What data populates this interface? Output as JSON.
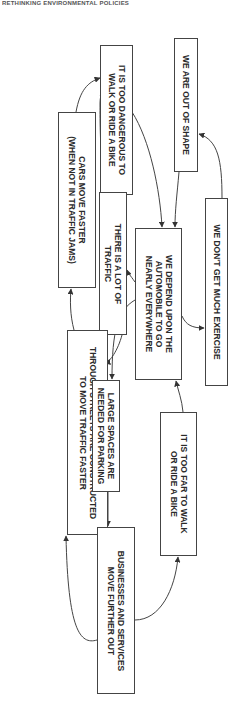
{
  "header": {
    "text": "RETHINKING ENVIRONMENTAL POLICIES"
  },
  "diagram": {
    "nodes": [
      {
        "id": "out_of_shape",
        "lines": [
          "WE ARE OUT OF SHAPE"
        ]
      },
      {
        "id": "no_exercise",
        "lines": [
          "WE DON'T GET MUCH EXERCISE"
        ]
      },
      {
        "id": "too_dangerous",
        "lines": [
          "IT IS TOO DANGEROUS TO",
          "WALK OR RIDE A BIKE"
        ]
      },
      {
        "id": "cars_faster",
        "lines": [
          "CARS MOVE FASTER",
          "(WHEN NOT IN TRAFFIC JAMS)"
        ]
      },
      {
        "id": "lot_of_traffic",
        "lines": [
          "THERE IS A LOT OF",
          "TRAFFIC"
        ]
      },
      {
        "id": "depend_auto",
        "lines": [
          "WE DEPEND UPON  THE",
          "AUTOMOBILE TO GO",
          "NEARLY EVERYWHERE"
        ]
      },
      {
        "id": "through_streets",
        "lines": [
          "THROUGH STREETS ARE CONSTRUCTED",
          "TO MOVE TRAFFIC FASTER"
        ]
      },
      {
        "id": "large_spaces",
        "lines": [
          "LARGE SPACES ARE",
          "NEEDED FOR PARKING"
        ]
      },
      {
        "id": "too_far",
        "lines": [
          "IT IS TOO FAR TO WALK",
          "OR RIDE A BIKE"
        ]
      },
      {
        "id": "businesses_out",
        "lines": [
          "BUSINESSES AND SERVICES",
          "MOVE FURTHER OUT"
        ]
      }
    ],
    "edges": [
      {
        "from": "no_exercise",
        "to": "out_of_shape"
      },
      {
        "from": "out_of_shape",
        "to": "depend_auto"
      },
      {
        "from": "too_dangerous",
        "to": "depend_auto"
      },
      {
        "from": "depend_auto",
        "to": "no_exercise"
      },
      {
        "from": "depend_auto",
        "to": "lot_of_traffic"
      },
      {
        "from": "depend_auto",
        "to": "large_spaces"
      },
      {
        "from": "lot_of_traffic",
        "to": "too_dangerous"
      },
      {
        "from": "lot_of_traffic",
        "to": "through_streets"
      },
      {
        "from": "cars_faster",
        "to": "too_dangerous"
      },
      {
        "from": "through_streets",
        "to": "cars_faster"
      },
      {
        "from": "large_spaces",
        "to": "businesses_out"
      },
      {
        "from": "businesses_out",
        "to": "through_streets"
      },
      {
        "from": "businesses_out",
        "to": "too_far"
      },
      {
        "from": "too_far",
        "to": "depend_auto"
      }
    ]
  }
}
